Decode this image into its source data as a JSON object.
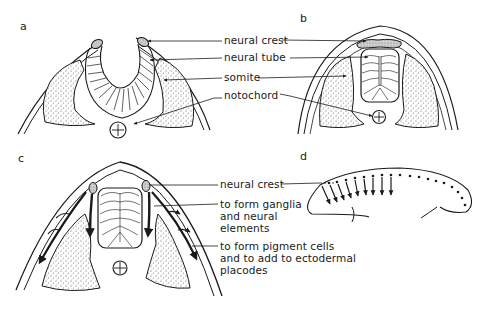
{
  "figure": {
    "panels": [
      {
        "id": "a",
        "letter": "a",
        "description": "Neural fold stage: open neural groove with neural crest at fold tips"
      },
      {
        "id": "b",
        "letter": "b",
        "description": "Neural tube closed; neural crest lies dorsal to tube"
      },
      {
        "id": "c",
        "letter": "c",
        "description": "Neural crest cells migrating ventrally and dorsolaterally"
      },
      {
        "id": "d",
        "letter": "d",
        "description": "Lateral view of embryo showing neural crest cells migrating along the body axis"
      }
    ],
    "labels_ab": {
      "neural_crest": "neural crest",
      "neural_tube": "neural tube",
      "somite": "somite",
      "notochord": "notochord"
    },
    "labels_cd": {
      "neural_crest": "neural crest",
      "ganglia_line1": "to form ganglia",
      "ganglia_line2": "and neural",
      "ganglia_line3": "elements",
      "pigment_line1": "to form pigment cells",
      "pigment_line2": "and to add to ectodermal",
      "pigment_line3": "placodes"
    },
    "colors": {
      "ink": "#1a1a1a",
      "background": "#ffffff",
      "stipple": "#555555"
    }
  }
}
